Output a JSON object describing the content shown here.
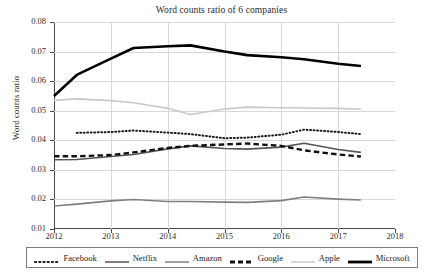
{
  "chart_data": {
    "type": "line",
    "title": "Word counts ratio of 6 companies",
    "xlabel": "",
    "ylabel": "Word counts ratio",
    "xlim": [
      2012,
      2018
    ],
    "ylim": [
      0.01,
      0.08
    ],
    "xticks": [
      "2012",
      "2013",
      "2014",
      "2015",
      "2016",
      "2017",
      "2018"
    ],
    "yticks": [
      "0.01",
      "0.02",
      "0.03",
      "0.04",
      "0.05",
      "0.06",
      "0.07",
      "0.08"
    ],
    "grid": true,
    "legend_position": "bottom",
    "x": [
      2012.0,
      2012.4,
      2013.0,
      2013.4,
      2014.0,
      2014.4,
      2015.0,
      2015.4,
      2016.0,
      2016.4,
      2017.0,
      2017.4
    ],
    "series": [
      {
        "name": "Facebook",
        "style": "dotted",
        "color": "#1a1a1a",
        "x": [
          2012.4,
          2013.0,
          2013.4,
          2014.0,
          2014.4,
          2015.0,
          2015.4,
          2016.0,
          2016.4,
          2017.0,
          2017.4
        ],
        "values": [
          0.0425,
          0.0428,
          0.0433,
          0.0426,
          0.0421,
          0.0407,
          0.0409,
          0.0419,
          0.0436,
          0.0428,
          0.0421
        ]
      },
      {
        "name": "Netflix",
        "style": "solid",
        "color": "#555555",
        "values": [
          0.0334,
          0.0335,
          0.0345,
          0.0352,
          0.0371,
          0.0381,
          0.0372,
          0.037,
          0.0377,
          0.039,
          0.0369,
          0.0359
        ]
      },
      {
        "name": "Amazon",
        "style": "solid",
        "color": "#808080",
        "values": [
          0.0178,
          0.0184,
          0.0195,
          0.02,
          0.0193,
          0.0193,
          0.0191,
          0.019,
          0.0196,
          0.0208,
          0.0201,
          0.0198
        ]
      },
      {
        "name": "Google",
        "style": "dashed",
        "color": "#111111",
        "values": [
          0.0346,
          0.0346,
          0.035,
          0.0359,
          0.0374,
          0.0381,
          0.0386,
          0.0389,
          0.0381,
          0.0366,
          0.0352,
          0.0345
        ]
      },
      {
        "name": "Apple",
        "style": "solid",
        "color": "#c8c8c8",
        "values": [
          0.0535,
          0.054,
          0.0534,
          0.0527,
          0.0508,
          0.0487,
          0.0506,
          0.0512,
          0.051,
          0.0509,
          0.0508,
          0.0505
        ]
      },
      {
        "name": "Microsoft",
        "style": "solid",
        "color": "#000000",
        "values": [
          0.055,
          0.0621,
          0.0676,
          0.0712,
          0.0718,
          0.0721,
          0.07,
          0.0688,
          0.0681,
          0.0674,
          0.0659,
          0.0651
        ]
      }
    ]
  },
  "legend": [
    {
      "label": "Facebook"
    },
    {
      "label": "Netflix"
    },
    {
      "label": "Amazon"
    },
    {
      "label": "Google"
    },
    {
      "label": "Apple"
    },
    {
      "label": "Microsoft"
    }
  ]
}
